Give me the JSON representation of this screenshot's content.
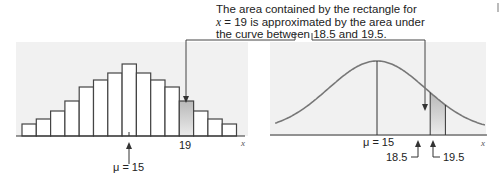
{
  "caption": {
    "line1": "The area contained by the rectangle for",
    "line2_var": "x",
    "line2_rest": " = 19 is approximated by the area under",
    "line3": "the curve between 18.5 and 19.5."
  },
  "histogram": {
    "x_axis_label": "x",
    "highlight_label": "19",
    "mu_label": "μ = 15"
  },
  "normal_curve": {
    "x_axis_label": "x",
    "mu_label": "μ = 15",
    "lower_label": "18.5",
    "upper_label": "19.5"
  },
  "colors": {
    "bar_fill": "#ffffff",
    "bar_stroke": "#444444",
    "panel_bg": "#f1f1f1",
    "highlight_fill": "#cfcfcf",
    "curve_stroke": "#777777",
    "axis": "#333333"
  },
  "chart_data": [
    {
      "type": "bar",
      "title": "Binomial histogram",
      "xlabel": "x",
      "ylabel": "",
      "categories": [
        8,
        9,
        10,
        11,
        12,
        13,
        14,
        15,
        16,
        17,
        18,
        19,
        20,
        21,
        22
      ],
      "values": [
        12,
        17,
        25,
        35,
        49,
        56,
        63,
        72,
        63,
        56,
        49,
        35,
        25,
        17,
        12
      ],
      "annotations": [
        "μ = 15",
        "19 (shaded bar)"
      ],
      "highlight": {
        "x": 19
      },
      "grid": false
    },
    {
      "type": "line",
      "title": "Normal approximation curve",
      "xlabel": "x",
      "ylabel": "",
      "mean": 15,
      "shaded_region": [
        18.5,
        19.5
      ],
      "annotations": [
        "μ = 15",
        "18.5",
        "19.5"
      ],
      "grid": false
    }
  ]
}
